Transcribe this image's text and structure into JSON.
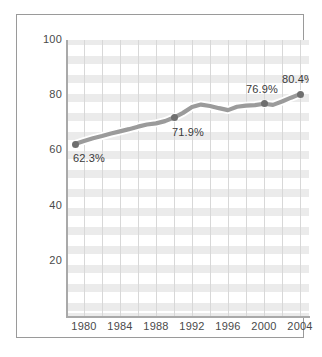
{
  "chart_data": {
    "type": "line",
    "title": "",
    "subtitle": "",
    "xlabel": "",
    "ylabel": "",
    "xlim": [
      1978,
      2005
    ],
    "ylim": [
      0,
      100
    ],
    "grid": {
      "vertical": true,
      "horizontal_bands": true
    },
    "legend": {
      "visible": false,
      "position": "none"
    },
    "y_ticks": [
      {
        "value": 100,
        "label": "100"
      },
      {
        "value": 80,
        "label": "80"
      },
      {
        "value": 60,
        "label": "60"
      },
      {
        "value": 40,
        "label": "40"
      },
      {
        "value": 20,
        "label": "20"
      }
    ],
    "x_ticks": [
      {
        "value": 1980,
        "label": "1980"
      },
      {
        "value": 1984,
        "label": "1984"
      },
      {
        "value": 1988,
        "label": "1988"
      },
      {
        "value": 1992,
        "label": "1992"
      },
      {
        "value": 1996,
        "label": "1996"
      },
      {
        "value": 2000,
        "label": "2000"
      },
      {
        "value": 2004,
        "label": "2004"
      }
    ],
    "x_gridlines": [
      1980,
      1982,
      1984,
      1986,
      1988,
      1990,
      1992,
      1994,
      1996,
      1998,
      2000,
      2002,
      2004
    ],
    "series": [
      {
        "name": "Percent",
        "color": "#9b9b9b",
        "marker_color": "#6f6f6f",
        "x": [
          1979,
          1980,
          1981,
          1982,
          1983,
          1984,
          1985,
          1986,
          1987,
          1988,
          1989,
          1990,
          1991,
          1992,
          1993,
          1994,
          1995,
          1996,
          1997,
          1998,
          1999,
          2000,
          2001,
          2002,
          2003,
          2004
        ],
        "values": [
          62.3,
          63.4,
          64.4,
          65.2,
          66.1,
          66.9,
          67.7,
          68.6,
          69.4,
          69.8,
          70.6,
          71.9,
          73.6,
          75.7,
          76.6,
          76.1,
          75.3,
          74.6,
          75.8,
          76.2,
          76.4,
          76.9,
          76.5,
          77.7,
          79.1,
          80.4
        ]
      }
    ],
    "annotations": [
      {
        "x": 1979,
        "y": 62.3,
        "label": "62.3%",
        "position": "below"
      },
      {
        "x": 1990,
        "y": 71.9,
        "label": "71.9%",
        "position": "below"
      },
      {
        "x": 2000,
        "y": 76.9,
        "label": "76.9%",
        "position": "above"
      },
      {
        "x": 2004,
        "y": 80.4,
        "label": "80.4%",
        "position": "above"
      }
    ],
    "marker_points": [
      {
        "x": 1979,
        "y": 62.3
      },
      {
        "x": 1990,
        "y": 71.9
      },
      {
        "x": 2000,
        "y": 76.9
      },
      {
        "x": 2004,
        "y": 80.4
      }
    ]
  },
  "colors": {
    "line": "#9b9b9b",
    "line_highlight": "#ffffff",
    "marker": "#6f6f6f",
    "band": "#ebebeb",
    "gridline": "#d8d8d8",
    "axis": "#a9a9a9",
    "frame": "#9a9a9a",
    "text": "#4a4a4a",
    "background": "#ffffff"
  }
}
